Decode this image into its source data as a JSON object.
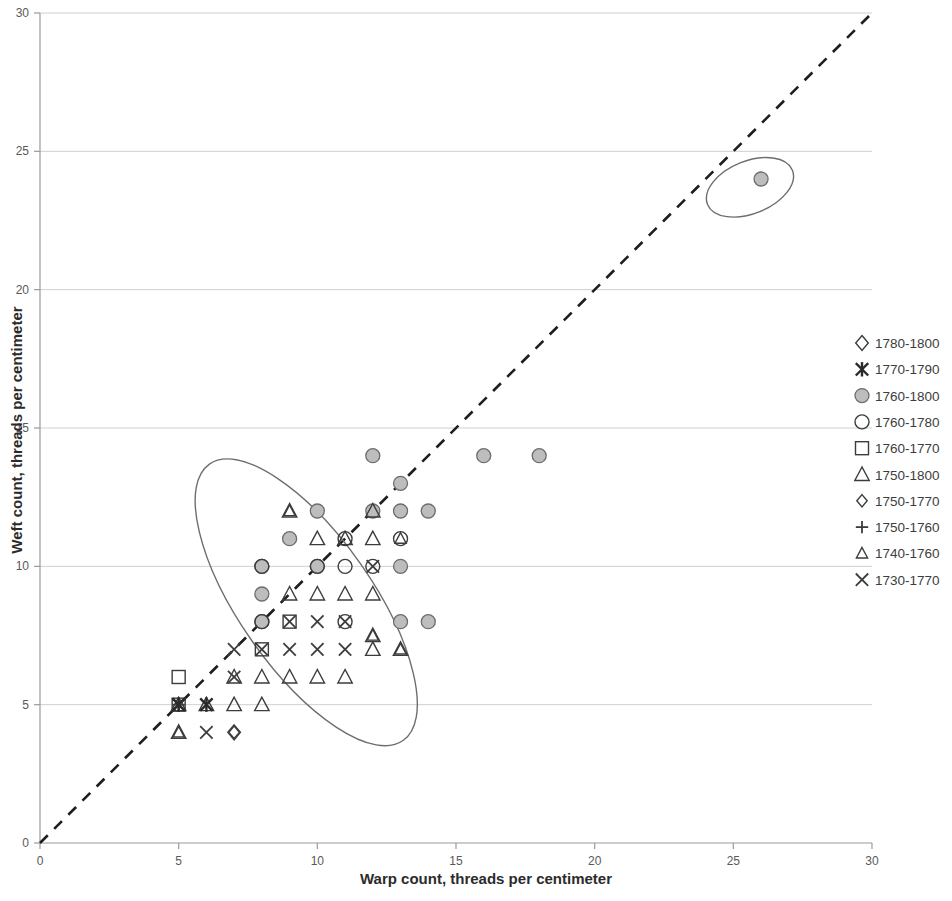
{
  "chart_data": {
    "type": "scatter",
    "title": "",
    "xlabel": "Warp count, threads per centimeter",
    "ylabel": "Weft count, threads per centimeter",
    "xlim": [
      0,
      30
    ],
    "ylim": [
      0,
      30
    ],
    "xticks": [
      0,
      5,
      10,
      15,
      20,
      25,
      30
    ],
    "yticks": [
      0,
      5,
      10,
      15,
      20,
      25,
      30
    ],
    "grid": "horizontal",
    "legend_position": "right",
    "reference_line": {
      "label": "1:1 diagonal",
      "style": "dashed",
      "from": [
        0,
        0
      ],
      "to": [
        30,
        30
      ]
    },
    "annotations": [
      {
        "shape": "ellipse",
        "name": "main-cluster-ellipse",
        "center": [
          9.6,
          8.7
        ],
        "rx": 2.4,
        "ry": 6.1,
        "rotation": -35
      },
      {
        "shape": "ellipse",
        "name": "outlier-ellipse",
        "center": [
          25.6,
          23.7
        ],
        "rx": 1.65,
        "ry": 0.95,
        "rotation": -22
      }
    ],
    "series": [
      {
        "name": "1780-1800",
        "marker": "diamond-open",
        "points": [
          [
            7,
            4
          ]
        ]
      },
      {
        "name": "1770-1790",
        "marker": "asterisk",
        "points": [
          [
            6,
            5
          ],
          [
            5,
            5
          ]
        ]
      },
      {
        "name": "1760-1800",
        "marker": "circle-filled-gray",
        "points": [
          [
            12,
            14
          ],
          [
            16,
            14
          ],
          [
            18,
            14
          ],
          [
            26,
            24
          ],
          [
            13,
            13
          ],
          [
            10,
            12
          ],
          [
            12,
            12
          ],
          [
            13,
            12
          ],
          [
            14,
            12
          ],
          [
            8,
            10
          ],
          [
            10,
            10
          ],
          [
            13,
            10
          ],
          [
            8,
            9
          ],
          [
            9,
            11
          ],
          [
            8,
            8
          ],
          [
            13,
            8
          ],
          [
            14,
            8
          ]
        ]
      },
      {
        "name": "1760-1780",
        "marker": "circle-open",
        "points": [
          [
            11,
            11
          ],
          [
            13,
            11
          ],
          [
            8,
            10
          ],
          [
            10,
            10
          ],
          [
            11,
            10
          ],
          [
            8,
            8
          ],
          [
            11,
            8
          ],
          [
            12,
            10
          ]
        ]
      },
      {
        "name": "1760-1770",
        "marker": "square-open",
        "points": [
          [
            9,
            8
          ],
          [
            8,
            7
          ],
          [
            5,
            5
          ],
          [
            5,
            6
          ]
        ]
      },
      {
        "name": "1750-1800",
        "marker": "triangle-open",
        "points": [
          [
            9,
            12
          ],
          [
            10,
            11
          ],
          [
            11,
            11
          ],
          [
            12,
            12
          ],
          [
            9,
            9
          ],
          [
            10,
            9
          ],
          [
            11,
            9
          ],
          [
            12,
            9
          ],
          [
            12,
            11
          ],
          [
            12,
            7.5
          ],
          [
            12,
            7
          ],
          [
            13,
            7
          ],
          [
            7,
            6
          ],
          [
            8,
            6
          ],
          [
            9,
            6
          ],
          [
            10,
            6
          ],
          [
            11,
            6
          ],
          [
            5,
            5
          ],
          [
            6,
            5
          ],
          [
            7,
            5
          ],
          [
            8,
            5
          ],
          [
            5,
            4
          ]
        ]
      },
      {
        "name": "1750-1770",
        "marker": "diamond-small",
        "points": [
          [
            7,
            4
          ]
        ]
      },
      {
        "name": "1750-1760",
        "marker": "plus",
        "points": [
          [
            5,
            5
          ]
        ]
      },
      {
        "name": "1740-1760",
        "marker": "triangle-small",
        "points": [
          [
            9,
            12
          ],
          [
            13,
            11
          ],
          [
            12,
            7.5
          ],
          [
            13,
            7
          ],
          [
            5,
            4
          ]
        ]
      },
      {
        "name": "1730-1770",
        "marker": "cross",
        "points": [
          [
            12,
            10
          ],
          [
            10,
            8
          ],
          [
            11,
            8
          ],
          [
            9,
            8
          ],
          [
            8,
            7
          ],
          [
            9,
            7
          ],
          [
            10,
            7
          ],
          [
            11,
            7
          ],
          [
            7,
            7
          ],
          [
            7,
            6
          ],
          [
            6,
            4
          ],
          [
            5,
            5
          ]
        ]
      }
    ]
  },
  "legend": {
    "items": [
      {
        "label": "1780-1800",
        "marker": "diamond-open"
      },
      {
        "label": "1770-1790",
        "marker": "asterisk"
      },
      {
        "label": "1760-1800",
        "marker": "circle-filled-gray"
      },
      {
        "label": "1760-1780",
        "marker": "circle-open"
      },
      {
        "label": "1760-1770",
        "marker": "square-open"
      },
      {
        "label": "1750-1800",
        "marker": "triangle-open"
      },
      {
        "label": "1750-1770",
        "marker": "diamond-small"
      },
      {
        "label": "1750-1760",
        "marker": "plus"
      },
      {
        "label": "1740-1760",
        "marker": "triangle-small"
      },
      {
        "label": "1730-1770",
        "marker": "cross"
      }
    ]
  },
  "axes": {
    "x_title": "Warp count, threads per centimeter",
    "y_title": "Weft count, threads per centimeter",
    "x_tick_labels": [
      "0",
      "5",
      "10",
      "15",
      "20",
      "25",
      "30"
    ],
    "y_tick_labels": [
      "0",
      "5",
      "10",
      "15",
      "20",
      "25",
      "30"
    ]
  },
  "colors": {
    "marker_gray_fill": "#bdbdbd",
    "marker_stroke": "#3c3c3c",
    "gridline": "#d0d0d0",
    "axis": "#9a9a9a",
    "diagonal": "#1e1e1e",
    "ellipse": "#6e6e6e",
    "text": "#3a3a3a"
  }
}
